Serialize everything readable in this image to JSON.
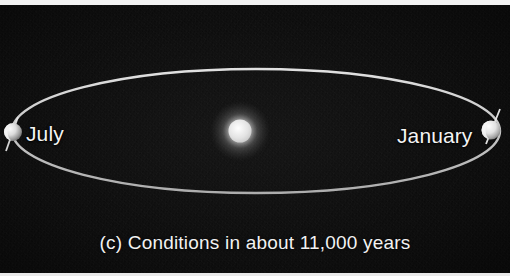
{
  "figure": {
    "caption": "(c) Conditions in about 11,000 years",
    "background_color": "#080808",
    "border_color": "#f2f2f2"
  },
  "diagram": {
    "type": "orbit-diagram",
    "orbit": {
      "name": "earth-orbit-ellipse",
      "center_x": 256,
      "center_y": 126,
      "radius_x": 244,
      "radius_y": 62,
      "stroke_color": "#d8d8d8",
      "stroke_width": 2.4
    },
    "sun": {
      "name": "sun",
      "x": 240,
      "y": 126,
      "radius": 11,
      "core_color": "#e8e8e8",
      "glow_color": "#b5b5b5"
    },
    "bodies": [
      {
        "name": "earth-july",
        "label": "July",
        "x": 13,
        "y": 127,
        "radius": 9,
        "axis_tilt_deg": 23,
        "body_color": "#e2e2e2",
        "shadow_color": "#6b6b6b"
      },
      {
        "name": "earth-january",
        "label": "January",
        "x": 491,
        "y": 125,
        "radius": 9,
        "axis_tilt_deg": 23,
        "body_color": "#e6e6e6",
        "shadow_color": "#7a7a7a"
      }
    ]
  },
  "labels": {
    "july": "July",
    "january": "January"
  }
}
